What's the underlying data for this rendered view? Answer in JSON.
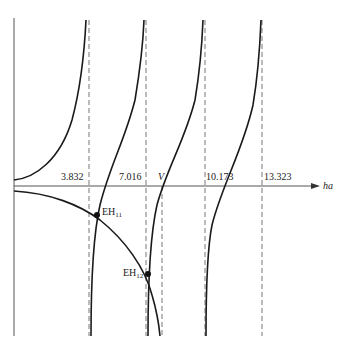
{
  "diagram": {
    "type": "eigenvalue-graphical-solution",
    "axis": {
      "label": "ha",
      "ticks": [
        {
          "value": "3.832",
          "x": 89
        },
        {
          "value": "7.016",
          "x": 146
        },
        {
          "value": "10.173",
          "x": 205
        },
        {
          "value": "13.323",
          "x": 262
        }
      ],
      "cutoff_marker": {
        "label": "V",
        "x": 162
      }
    },
    "intersections": [
      {
        "label": "EH",
        "sub": "11",
        "x": 97,
        "y": 215
      },
      {
        "label": "EH",
        "sub": "12",
        "x": 148,
        "y": 274
      }
    ],
    "colors": {
      "line": "#1a1a1a",
      "dashed": "#777777",
      "background": "#ffffff"
    }
  }
}
